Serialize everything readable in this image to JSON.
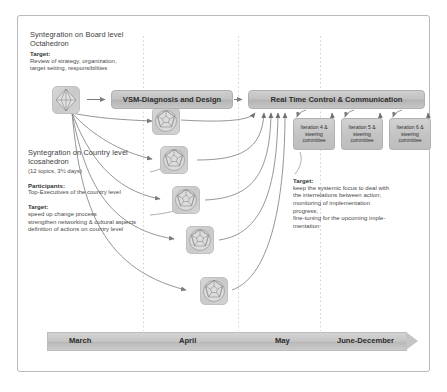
{
  "diagram": {
    "colors": {
      "bar_fill": "#c4c4c4",
      "bar_border": "#b0b0b0",
      "frame_border": "#b9b9b9",
      "arrow": "#7d7d7d",
      "dashed_guide": "#d0d0d0",
      "text": "#3a3a3a"
    }
  },
  "board_block": {
    "line1": "Syntegration on Board level",
    "line2": "Octahedron",
    "target_label": "Target:",
    "target_lines": [
      "Review of strategy, organization,",
      "target setting, responsibilities"
    ]
  },
  "country_block": {
    "line1": "Syntegration on Country level",
    "line2": "Icosahedron",
    "line3": "(12 topics, 3½ days)",
    "participants_label": "Participants:",
    "participants_text": "Top-Executives of the country level",
    "target_label": "Target:",
    "target_lines": [
      "speed up change process",
      "strengthen networking & cultural aspects",
      "definition of actions on country level"
    ]
  },
  "right_target": {
    "target_label": "Target:",
    "target_lines": [
      "keep the systemic focus to deal with",
      "the interrelations between action;",
      "monitoring of implementation",
      "progress;",
      "fine-tuning for the upcoming imple-",
      "mentation"
    ]
  },
  "process_bars": [
    {
      "id": "vsm",
      "label": "VSM-Diagnosis and Design"
    },
    {
      "id": "rtc",
      "label": "Real Time Control & Communication"
    }
  ],
  "steering_committees": [
    {
      "line1": "Iteration 4 &",
      "line2": "steering",
      "line3": "committee"
    },
    {
      "line1": "Iteration 5 &",
      "line2": "steering",
      "line3": "committee"
    },
    {
      "line1": "Iteration 6 &",
      "line2": "steering",
      "line3": "committee"
    }
  ],
  "nodes": [
    {
      "name": "octahedron-node",
      "shape": "octahedron"
    },
    {
      "name": "icosahedron-node-1",
      "shape": "icosahedron"
    },
    {
      "name": "icosahedron-node-2",
      "shape": "icosahedron"
    },
    {
      "name": "icosahedron-node-3",
      "shape": "icosahedron"
    },
    {
      "name": "icosahedron-node-4",
      "shape": "icosahedron"
    },
    {
      "name": "icosahedron-node-5",
      "shape": "icosahedron"
    }
  ],
  "timeline": {
    "labels": [
      "March",
      "April",
      "May",
      "June-December"
    ]
  }
}
